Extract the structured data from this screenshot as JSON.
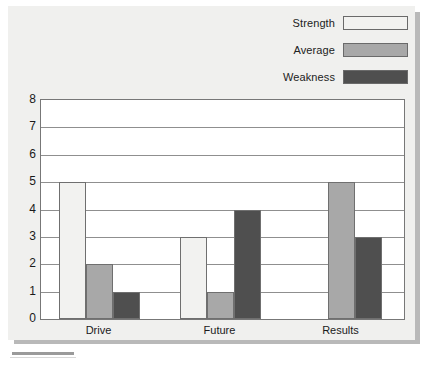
{
  "chart_data": {
    "type": "bar",
    "title": "",
    "xlabel": "",
    "ylabel": "",
    "categories": [
      "Drive",
      "Future",
      "Results"
    ],
    "series": [
      {
        "name": "Strength",
        "values": [
          5,
          3,
          0
        ],
        "color": "#f2f2f0"
      },
      {
        "name": "Average",
        "values": [
          2,
          1,
          5
        ],
        "color": "#a8a8a8"
      },
      {
        "name": "Weakness",
        "values": [
          1,
          4,
          3
        ],
        "color": "#4f4f4f"
      }
    ],
    "ylim": [
      0,
      8
    ],
    "yticks": [
      0,
      1,
      2,
      3,
      4,
      5,
      6,
      7,
      8
    ],
    "ytick_labels": [
      "0",
      "1",
      "2",
      "3",
      "4",
      "5",
      "6",
      "7",
      "8"
    ],
    "grid": true,
    "legend_position": "top-right",
    "background_color": "#f0f0ee",
    "plot_background_color": "#ffffff",
    "axis_color": "#777777",
    "gridline_color": "#8f8f8f",
    "bar_border_color": "#6f6f6f"
  },
  "legend": {
    "items": [
      {
        "label": "Strength",
        "color": "#f2f2f0"
      },
      {
        "label": "Average",
        "color": "#a8a8a8"
      },
      {
        "label": "Weakness",
        "color": "#4f4f4f"
      }
    ]
  }
}
